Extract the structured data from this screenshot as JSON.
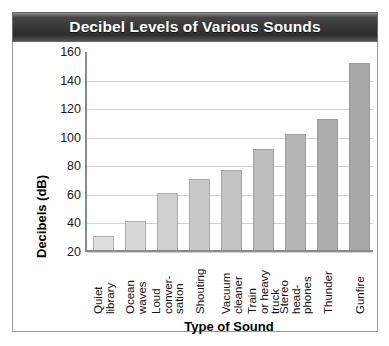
{
  "chart": {
    "title": "Decibel Levels of Various Sounds"
  },
  "chart_data": {
    "type": "bar",
    "title": "Decibel Levels of Various Sounds",
    "xlabel": "Type of Sound",
    "ylabel": "Decibels (dB)",
    "ylim": [
      20,
      160
    ],
    "ytick_step": 20,
    "yticks": [
      "160",
      "140",
      "120",
      "100",
      "80",
      "60",
      "40",
      "20"
    ],
    "grid": true,
    "legend": "none",
    "categories": [
      "Quiet\nlibrary",
      "Ocean\nwaves",
      "Loud\nconver-\nsation",
      "Shouting",
      "Vacuum\ncleaner",
      "Train\nor heavy\ntruck",
      "Stereo\nhead-\nphones",
      "Thunder",
      "Gunfire"
    ],
    "categories_flat": [
      "Quiet library",
      "Ocean waves",
      "Loud conver-sation",
      "Shouting",
      "Vacuum cleaner",
      "Train or heavy truck",
      "Stereo head-phones",
      "Thunder",
      "Gunfire"
    ],
    "values": [
      30,
      40,
      60,
      70,
      76,
      91,
      101,
      112,
      151
    ],
    "bar_colors": [
      "#dedede",
      "#d8d8d8",
      "#d0d0d0",
      "#c9c9c9",
      "#c3c3c3",
      "#bdbdbd",
      "#b5b5b5",
      "#aeaeae",
      "#a8a8a8"
    ]
  },
  "colors": {
    "titlebar_text": "#ffffff",
    "axis": "#8a8a8a",
    "grid": "#d2d2d2",
    "frame": "#9a9a9a"
  }
}
